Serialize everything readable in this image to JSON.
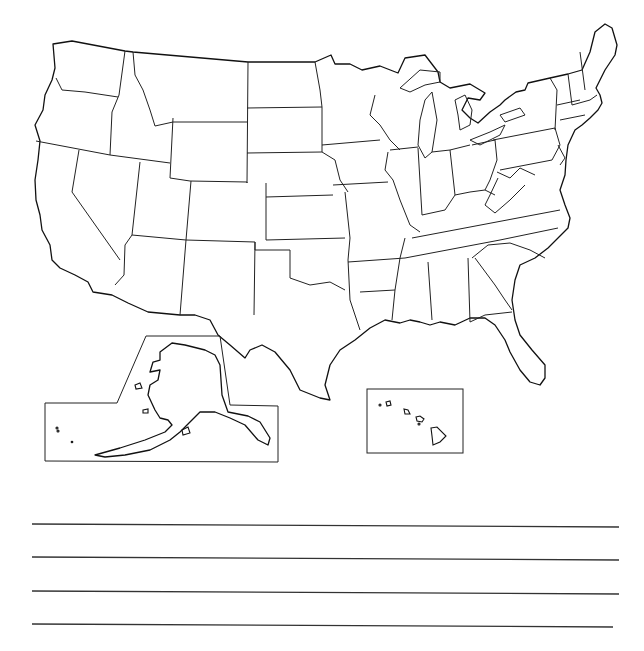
{
  "worksheet": {
    "title": "",
    "map": {
      "subject": "Outline map of the United States",
      "labels": [],
      "insets": [
        {
          "name": "alaska-inset"
        },
        {
          "name": "hawaii-inset"
        }
      ],
      "stroke_color": "#111111",
      "background": "#ffffff"
    },
    "answer_lines": {
      "count": 4,
      "values": [
        "",
        "",
        "",
        ""
      ]
    }
  }
}
